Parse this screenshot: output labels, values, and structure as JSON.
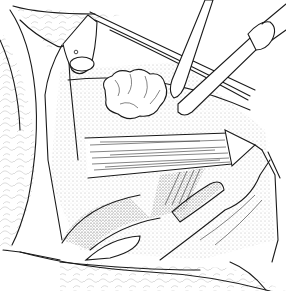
{
  "figure": {
    "kind": "surgical line illustration",
    "style": "black ink stipple and line drawing on white",
    "colors": {
      "ink": "#1a1a1a",
      "background": "#ffffff",
      "stipple": "#9a9a9a"
    },
    "elements": [
      "retracted-tissue-flaps",
      "fat-lobules",
      "surgical-instrument-left",
      "surgical-instrument-right",
      "muscle-band",
      "clamp-tip",
      "vessel"
    ]
  }
}
